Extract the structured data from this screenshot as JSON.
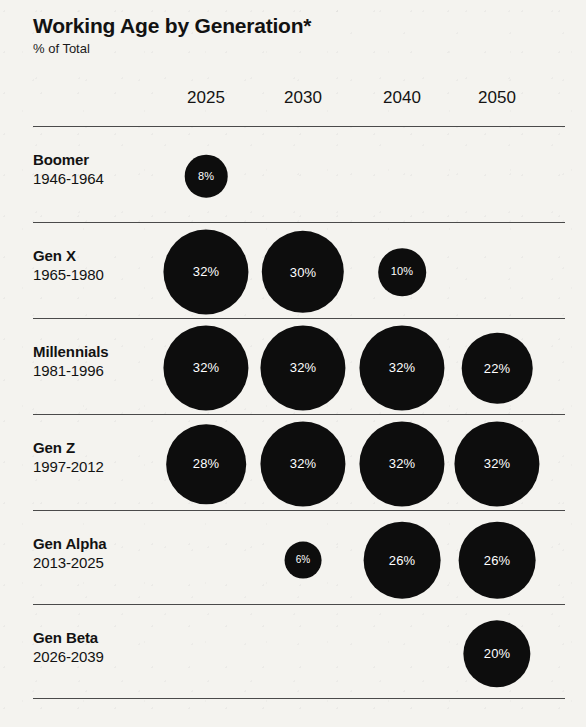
{
  "header": {
    "title": "Working Age by Generation*",
    "subtitle": "% of Total"
  },
  "colors": {
    "background": "#f4f3ef",
    "bubble": "#0d0d0d",
    "bubble_label": "#ffffff",
    "rule": "#4a4a4a",
    "text": "#121212"
  },
  "chart_data": {
    "type": "bubble",
    "title": "Working Age by Generation*",
    "subtitle": "% of Total",
    "xlabel": "",
    "ylabel": "",
    "unit": "%",
    "legend": "none",
    "grid": false,
    "note": "Bubble area scales with percentage value",
    "categories": [
      "2025",
      "2030",
      "2040",
      "2050"
    ],
    "rows": [
      {
        "generation": "Boomer",
        "years": "1946-1964",
        "values": [
          8,
          null,
          null,
          null
        ],
        "labels": [
          "8%",
          "",
          "",
          ""
        ]
      },
      {
        "generation": "Gen X",
        "years": "1965-1980",
        "values": [
          32,
          30,
          10,
          null
        ],
        "labels": [
          "32%",
          "30%",
          "10%",
          ""
        ]
      },
      {
        "generation": "Millennials",
        "years": "1981-1996",
        "values": [
          32,
          32,
          32,
          22
        ],
        "labels": [
          "32%",
          "32%",
          "32%",
          "22%"
        ]
      },
      {
        "generation": "Gen Z",
        "years": "1997-2012",
        "values": [
          28,
          32,
          32,
          32
        ],
        "labels": [
          "28%",
          "32%",
          "32%",
          "32%"
        ]
      },
      {
        "generation": "Gen Alpha",
        "years": "2013-2025",
        "values": [
          null,
          6,
          26,
          26
        ],
        "labels": [
          "",
          "6%",
          "26%",
          "26%"
        ]
      },
      {
        "generation": "Gen Beta",
        "years": "2026-2039",
        "values": [
          null,
          null,
          null,
          20
        ],
        "labels": [
          "",
          "",
          "",
          "20%"
        ]
      }
    ]
  },
  "layout": {
    "column_centers": [
      206,
      303,
      402,
      497
    ],
    "row_rules_y": [
      126,
      222,
      318,
      414,
      510,
      604,
      698
    ],
    "row_centers_y": [
      176,
      272,
      368,
      464,
      560,
      654
    ],
    "label_tops_y": [
      150,
      246,
      342,
      438,
      534,
      628
    ]
  }
}
